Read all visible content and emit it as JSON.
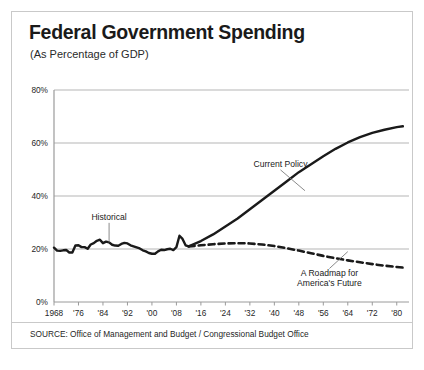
{
  "header": {
    "title": "Federal Government Spending",
    "subtitle": "(As Percentage of GDP)"
  },
  "footer": {
    "source": "SOURCE: Office of Management and Budget / Congressional Budget Office"
  },
  "colors": {
    "line": "#1a1a1a",
    "grid": "#b5b5b5",
    "axis": "#9a9a9a",
    "border": "#c9c9c9",
    "text": "#1f1f1f",
    "background": "#ffffff"
  },
  "chart_data": {
    "type": "line",
    "title": "Federal Government Spending",
    "subtitle": "(As Percentage of GDP)",
    "xlabel": "",
    "ylabel": "",
    "xlim": [
      1968,
      2084
    ],
    "ylim": [
      0,
      80
    ],
    "grid": true,
    "legend": "annotations",
    "ytick_labels": [
      "0%",
      "20%",
      "40%",
      "60%",
      "80%"
    ],
    "ytick_values": [
      0,
      20,
      40,
      60,
      80
    ],
    "xtick_labels": [
      "1968",
      "'76",
      "'84",
      "'92",
      "'00",
      "'08",
      "'16",
      "'24",
      "'32",
      "'40",
      "'48",
      "'56",
      "'64",
      "'72",
      "'80"
    ],
    "xtick_values": [
      1968,
      1976,
      1984,
      1992,
      2000,
      2008,
      2016,
      2024,
      2032,
      2040,
      2048,
      2056,
      2064,
      2072,
      2080
    ],
    "annotations": [
      {
        "label": "Historical",
        "x": 1986,
        "y": 31,
        "target_x": 1986,
        "target_y": 22.5
      },
      {
        "label": "Current Policy",
        "x": 2042,
        "y": 51,
        "target_x": 2050,
        "target_y": 42
      },
      {
        "label": "A Roadmap for",
        "label2": "America's Future",
        "x": 2058,
        "y": 10,
        "target_x": 2064,
        "target_y": 19
      }
    ],
    "series": [
      {
        "name": "Historical",
        "style": "solid",
        "points": [
          [
            1968,
            20.5
          ],
          [
            1969,
            19.4
          ],
          [
            1970,
            19.3
          ],
          [
            1971,
            19.5
          ],
          [
            1972,
            19.6
          ],
          [
            1973,
            18.7
          ],
          [
            1974,
            18.7
          ],
          [
            1975,
            21.3
          ],
          [
            1976,
            21.4
          ],
          [
            1977,
            20.7
          ],
          [
            1978,
            20.7
          ],
          [
            1979,
            20.1
          ],
          [
            1980,
            21.7
          ],
          [
            1981,
            22.2
          ],
          [
            1982,
            23.1
          ],
          [
            1983,
            23.5
          ],
          [
            1984,
            22.2
          ],
          [
            1985,
            22.8
          ],
          [
            1986,
            22.5
          ],
          [
            1987,
            21.6
          ],
          [
            1988,
            21.3
          ],
          [
            1989,
            21.2
          ],
          [
            1990,
            21.9
          ],
          [
            1991,
            22.3
          ],
          [
            1992,
            22.1
          ],
          [
            1993,
            21.4
          ],
          [
            1994,
            21.0
          ],
          [
            1995,
            20.6
          ],
          [
            1996,
            20.2
          ],
          [
            1997,
            19.5
          ],
          [
            1998,
            19.1
          ],
          [
            1999,
            18.5
          ],
          [
            2000,
            18.2
          ],
          [
            2001,
            18.2
          ],
          [
            2002,
            19.1
          ],
          [
            2003,
            19.7
          ],
          [
            2004,
            19.6
          ],
          [
            2005,
            19.9
          ],
          [
            2006,
            20.1
          ],
          [
            2007,
            19.6
          ],
          [
            2008,
            20.7
          ],
          [
            2009,
            25.0
          ],
          [
            2010,
            23.8
          ],
          [
            2011,
            21.4
          ],
          [
            2012,
            21.0
          ]
        ]
      },
      {
        "name": "Current Policy",
        "style": "solid",
        "points": [
          [
            2012,
            21.0
          ],
          [
            2016,
            23.0
          ],
          [
            2020,
            25.5
          ],
          [
            2024,
            28.5
          ],
          [
            2028,
            31.5
          ],
          [
            2032,
            35.0
          ],
          [
            2036,
            38.5
          ],
          [
            2040,
            42.0
          ],
          [
            2044,
            45.5
          ],
          [
            2048,
            49.0
          ],
          [
            2052,
            52.0
          ],
          [
            2056,
            55.0
          ],
          [
            2060,
            57.8
          ],
          [
            2064,
            60.2
          ],
          [
            2068,
            62.2
          ],
          [
            2072,
            63.8
          ],
          [
            2076,
            65.0
          ],
          [
            2080,
            66.0
          ],
          [
            2082,
            66.3
          ]
        ]
      },
      {
        "name": "A Roadmap for America's Future",
        "style": "dashed",
        "points": [
          [
            2012,
            21.0
          ],
          [
            2016,
            21.4
          ],
          [
            2020,
            21.8
          ],
          [
            2024,
            22.1
          ],
          [
            2028,
            22.2
          ],
          [
            2032,
            22.1
          ],
          [
            2036,
            21.7
          ],
          [
            2040,
            21.1
          ],
          [
            2044,
            20.3
          ],
          [
            2048,
            19.4
          ],
          [
            2052,
            18.4
          ],
          [
            2056,
            17.4
          ],
          [
            2060,
            16.5
          ],
          [
            2064,
            15.7
          ],
          [
            2068,
            15.0
          ],
          [
            2072,
            14.3
          ],
          [
            2076,
            13.7
          ],
          [
            2080,
            13.2
          ],
          [
            2082,
            13.0
          ]
        ]
      }
    ]
  }
}
